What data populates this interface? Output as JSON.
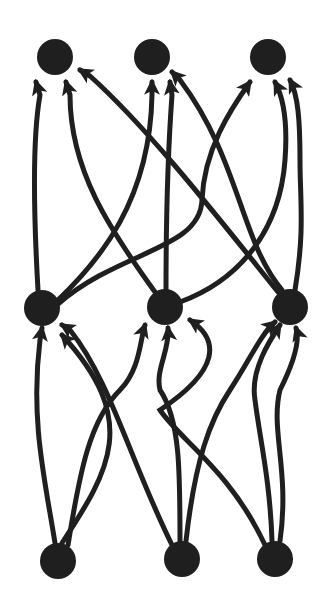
{
  "diagram": {
    "type": "directed-layered-graph",
    "colors": {
      "node": "#1f1f1f",
      "edge": "#1f1f1f",
      "background": "#ffffff"
    },
    "node_radius": 18,
    "edge_width": 5,
    "layers": [
      {
        "name": "bottom",
        "nodes": [
          {
            "id": "B1",
            "x": 58,
            "y": 561
          },
          {
            "id": "B2",
            "x": 182,
            "y": 559
          },
          {
            "id": "B3",
            "x": 275,
            "y": 559
          }
        ]
      },
      {
        "name": "middle",
        "nodes": [
          {
            "id": "M1",
            "x": 42,
            "y": 308
          },
          {
            "id": "M2",
            "x": 165,
            "y": 307
          },
          {
            "id": "M3",
            "x": 290,
            "y": 307
          }
        ]
      },
      {
        "name": "top",
        "nodes": [
          {
            "id": "T1",
            "x": 55,
            "y": 57
          },
          {
            "id": "T2",
            "x": 152,
            "y": 57
          },
          {
            "id": "T3",
            "x": 268,
            "y": 57
          }
        ]
      }
    ],
    "edges": [
      {
        "from": "M1",
        "to": "T1",
        "d": "M38 290 C34 220 32 140 40 95 L36 82"
      },
      {
        "from": "M2",
        "to": "T1",
        "d": "M155 292 C110 230 70 170 70 95 L66 82"
      },
      {
        "from": "M3",
        "to": "T1",
        "d": "M278 292 C220 220 150 130 90 76 L80 70"
      },
      {
        "from": "M1",
        "to": "T2",
        "d": "M58 300 C100 260 150 200 152 95 L152 82"
      },
      {
        "from": "M2",
        "to": "T2",
        "d": "M166 290 C166 220 168 150 172 95 L170 82"
      },
      {
        "from": "M3",
        "to": "T2",
        "d": "M282 290 C240 240 240 160 180 80 L172 72"
      },
      {
        "from": "M1",
        "to": "T3",
        "d": "M58 304 C120 250 200 250 202 200 C204 150 230 110 250 82"
      },
      {
        "from": "M2",
        "to": "T3",
        "d": "M180 302 C240 280 280 230 285 160 C288 120 282 95 275 82"
      },
      {
        "from": "M3",
        "to": "T3",
        "d": "M295 290 C305 230 300 200 300 160 C300 120 298 95 290 80"
      },
      {
        "from": "B1",
        "to": "M1",
        "d": "M55 543 C45 480 30 420 40 340 L42 328"
      },
      {
        "from": "B1",
        "to": "M1",
        "d": "M62 543 C110 470 140 420 62 335"
      },
      {
        "from": "B2",
        "to": "M1",
        "d": "M172 545 C130 460 110 380 70 330 L62 325"
      },
      {
        "from": "B1",
        "to": "M2",
        "d": "M68 545 C80 470 90 420 120 390 C140 370 140 340 145 325"
      },
      {
        "from": "B2",
        "to": "M2",
        "d": "M180 541 C180 470 180 420 160 390 C155 370 170 350 168 328"
      },
      {
        "from": "B3",
        "to": "M2",
        "d": "M265 545 C230 470 180 440 160 410 C220 370 220 340 190 320"
      },
      {
        "from": "B2",
        "to": "M3",
        "d": "M186 541 C195 460 210 420 230 390 C250 360 260 335 275 322"
      },
      {
        "from": "B3",
        "to": "M3",
        "d": "M272 541 C270 480 260 440 255 400 C250 370 270 340 280 325"
      },
      {
        "from": "B3",
        "to": "M3",
        "d": "M280 541 C290 470 270 430 280 390 C295 360 300 340 296 328"
      }
    ]
  }
}
